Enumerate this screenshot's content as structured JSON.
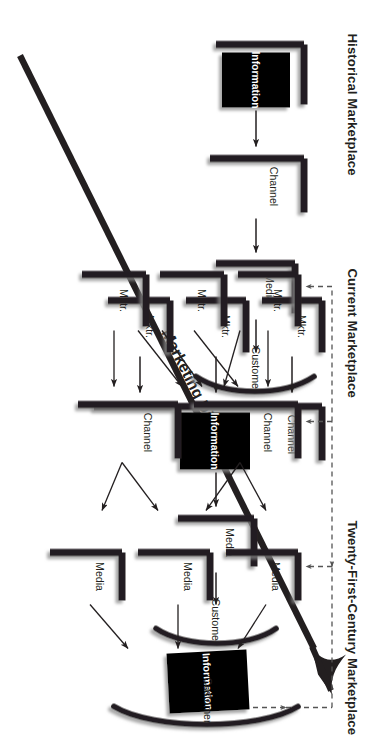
{
  "figure": {
    "type": "diagram",
    "subtype": "marketing-flow",
    "orientation": "rotated-90-clockwise",
    "background_color": "#ffffff",
    "ink_color": "#231f20",
    "information_box_fill": "#000000",
    "information_box_text_color": "#ffffff"
  },
  "diagonal": {
    "label": "Marketing Diagonal",
    "has_arrowhead": true,
    "arrowhead_end": "top-right"
  },
  "sections": [
    {
      "id": "historical",
      "title": "Historical Marketplace",
      "marketers": [
        "Marketer"
      ],
      "channels": [
        "Channel"
      ],
      "media": [
        "Media"
      ],
      "customer": "Customer",
      "information_label": "Information",
      "feedback_loop": false
    },
    {
      "id": "current",
      "title": "Current Marketplace",
      "marketers": [
        "Mktr.",
        "Mktr.",
        "Mktr."
      ],
      "channels": [
        "Channel"
      ],
      "media": [
        "Media"
      ],
      "customer": "Customer",
      "information_label": "Information",
      "feedback_loop": false
    },
    {
      "id": "twenty-first-century",
      "title": "Twenty-First-Century Marketplace",
      "marketers": [
        "Mktr.",
        "Mktr.",
        "Mktr."
      ],
      "channels": [
        "Channel",
        "Channel"
      ],
      "media": [
        "Media",
        "Media",
        "Media"
      ],
      "customer": "Customer",
      "information_label": "Information",
      "feedback_loop": true,
      "feedback_loop_style": "dashed",
      "feedback_targets": [
        "Mktr.",
        "Channel",
        "Media"
      ]
    }
  ]
}
